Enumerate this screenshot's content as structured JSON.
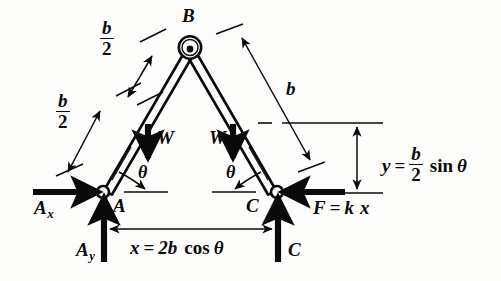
{
  "figure": {
    "kind": "statics-free-body-diagram",
    "background_color": "#fdfdfb",
    "ink_color": "#0a0a0a"
  },
  "joints": {
    "top": {
      "label": "B",
      "x": 188,
      "y": 46
    },
    "left": {
      "label": "A",
      "x": 103,
      "y": 192
    },
    "right": {
      "label": "C",
      "x": 277,
      "y": 192
    }
  },
  "labels": {
    "b_over_2_upper": {
      "numerator": "b",
      "denominator": "2"
    },
    "b_over_2_lower": {
      "numerator": "b",
      "denominator": "2"
    },
    "b_right": "b",
    "weight_left": "W",
    "weight_right": "W",
    "theta_left": "θ",
    "theta_right": "θ",
    "joint_b": "B",
    "joint_a": "A",
    "joint_c": "C",
    "reaction_ax": {
      "base": "A",
      "sub": "x"
    },
    "reaction_ay": {
      "base": "A",
      "sub": "y"
    },
    "reaction_c": "C"
  },
  "equations": {
    "spring_force": {
      "lhs": "F",
      "op": "=",
      "rhs_k": "k",
      "rhs_x": "x",
      "full": "F = k x"
    },
    "horizontal_span": {
      "lhs": "x",
      "op": "=",
      "coef": "2b",
      "fn": "cos",
      "arg": "θ",
      "full": "x = 2b cos θ"
    },
    "vertical_height": {
      "lhs": "y",
      "op": "=",
      "num": "b",
      "den": "2",
      "fn": "sin",
      "arg": "θ",
      "full": "y = b/2 sin θ"
    }
  },
  "dimensions": {
    "b_half_upper": "b/2",
    "b_half_lower": "b/2",
    "b_full": "b",
    "x_span": "x = 2b cos θ",
    "y_height": "y = b/2 sin θ"
  }
}
